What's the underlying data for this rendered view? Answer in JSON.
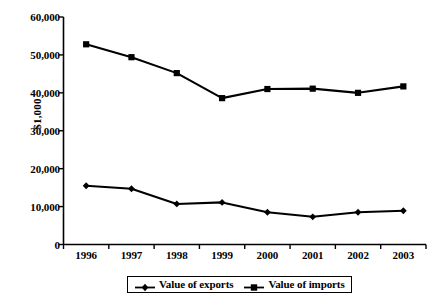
{
  "chart_data": {
    "type": "line",
    "title": "",
    "subtitle": "",
    "xlabel": "",
    "ylabel": "$1,000",
    "categories": [
      "1996",
      "1997",
      "1998",
      "1999",
      "2000",
      "2001",
      "2002",
      "2003"
    ],
    "ylim": [
      0,
      60000
    ],
    "ytick_values": [
      0,
      10000,
      20000,
      30000,
      40000,
      50000,
      60000
    ],
    "ytick_labels": [
      "0",
      "10,000",
      "20,000",
      "30,000",
      "40,000",
      "50,000",
      "60,000"
    ],
    "grid": false,
    "legend_position": "bottom",
    "series": [
      {
        "name": "Value of exports",
        "marker": "diamond",
        "color": "#000000",
        "values": [
          15500,
          14700,
          10700,
          11100,
          8500,
          7300,
          8500,
          8900
        ]
      },
      {
        "name": "Value of imports",
        "marker": "square",
        "color": "#000000",
        "values": [
          52800,
          49400,
          45200,
          38600,
          41000,
          41100,
          40000,
          41700
        ]
      }
    ]
  },
  "legend": {
    "entries": [
      {
        "label": "Value of exports",
        "marker": "diamond-marker"
      },
      {
        "label": "Value of imports",
        "marker": "square-marker"
      }
    ]
  },
  "axes": {
    "y_title": "$1,000"
  }
}
